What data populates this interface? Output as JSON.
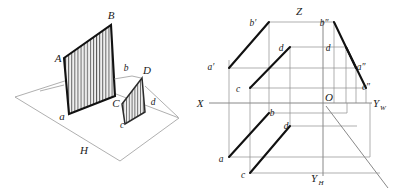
{
  "figure": {
    "colors": {
      "ink": "#111111",
      "thin_line": "#8d8d8d",
      "axis": "#7a7a7a",
      "hatch": "#4a4a4a",
      "background": "#ffffff"
    }
  },
  "pictorial": {
    "name": "axonometric-view",
    "plane_label": "H",
    "vertices": {
      "A": "A",
      "B": "B",
      "a": "a",
      "b": "b",
      "C": "C",
      "D": "D",
      "c": "c",
      "d": "d"
    },
    "labels": [
      {
        "id": "A",
        "text": "A",
        "x": 58,
        "y": 62
      },
      {
        "id": "B",
        "text": "B",
        "x": 111,
        "y": 19
      },
      {
        "id": "a",
        "text": "a",
        "x": 62,
        "y": 120
      },
      {
        "id": "b",
        "text": "b",
        "x": 126,
        "y": 71
      },
      {
        "id": "C",
        "text": "C",
        "x": 116,
        "y": 107
      },
      {
        "id": "D",
        "text": "D",
        "x": 146,
        "y": 73
      },
      {
        "id": "c",
        "text": "c",
        "x": 122,
        "y": 127
      },
      {
        "id": "d",
        "text": "d",
        "x": 152,
        "y": 105
      },
      {
        "id": "H",
        "text": "H",
        "x": 84,
        "y": 153
      }
    ]
  },
  "projection": {
    "name": "three-view-projection",
    "axes": [
      {
        "id": "x-axis",
        "label": "X",
        "x": 200,
        "y": 107
      },
      {
        "id": "z-axis",
        "label": "Z",
        "x": 299,
        "y": 14
      },
      {
        "id": "yw-axis",
        "label": "Y",
        "sub": "W",
        "x": 376,
        "y": 107
      },
      {
        "id": "yh-axis",
        "label": "Y",
        "sub": "H",
        "x": 314,
        "y": 182
      },
      {
        "id": "origin",
        "label": "O",
        "x": 326,
        "y": 104
      }
    ],
    "front_view": {
      "name": "front-view-labels",
      "labels": [
        {
          "id": "a-prime",
          "text": "a′",
          "x": 209,
          "y": 70
        },
        {
          "id": "b-prime",
          "text": "b′",
          "x": 250,
          "y": 26
        },
        {
          "id": "c-prime",
          "text": "c",
          "x": 235,
          "y": 92
        },
        {
          "id": "d-prime",
          "text": "d",
          "x": 280,
          "y": 51
        }
      ]
    },
    "side_view": {
      "name": "side-view-labels",
      "labels": [
        {
          "id": "a-dblprime",
          "text": "a″",
          "x": 358,
          "y": 70
        },
        {
          "id": "b-dblprime",
          "text": "b″",
          "x": 321,
          "y": 26
        },
        {
          "id": "c-dblprime",
          "text": "c″",
          "x": 362,
          "y": 90
        },
        {
          "id": "d-dblprime",
          "text": "d",
          "x": 326,
          "y": 51
        }
      ]
    },
    "top_view": {
      "name": "top-view-labels",
      "labels": [
        {
          "id": "a-top",
          "text": "a",
          "x": 219,
          "y": 162
        },
        {
          "id": "b-top",
          "text": "b",
          "x": 271,
          "y": 116
        },
        {
          "id": "c-top",
          "text": "c",
          "x": 241,
          "y": 178
        },
        {
          "id": "d-top",
          "text": "d",
          "x": 284,
          "y": 129
        }
      ]
    }
  }
}
